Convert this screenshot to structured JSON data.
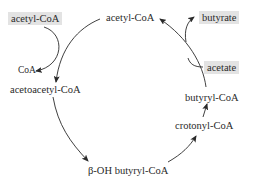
{
  "diagram": {
    "type": "metabolic-cycle",
    "nodes": {
      "acetyl_coa_input": "acetyl-CoA",
      "acetyl_coa": "acetyl-CoA",
      "butyrate": "butyrate",
      "coa": "CoA",
      "acetoacetyl_coa": "acetoacetyl-CoA",
      "acetate": "acetate",
      "butyryl_coa": "butyryl-CoA",
      "crotonyl_coa": "crotonyl-CoA",
      "beta_oh_butyryl_coa": "β-OH butyryl-CoA"
    },
    "edges": [
      {
        "from": "acetyl-CoA",
        "to": "acetoacetyl-CoA"
      },
      {
        "from": "acetyl-CoA (input)",
        "to": "acetoacetyl-CoA"
      },
      {
        "from": "acetyl-CoA (input)",
        "to": "CoA"
      },
      {
        "from": "acetoacetyl-CoA",
        "to": "β-OH butyryl-CoA"
      },
      {
        "from": "β-OH butyryl-CoA",
        "to": "crotonyl-CoA"
      },
      {
        "from": "crotonyl-CoA",
        "to": "butyryl-CoA"
      },
      {
        "from": "butyryl-CoA",
        "to": "acetyl-CoA"
      },
      {
        "from": "acetate",
        "to": "acetyl-CoA"
      },
      {
        "from": "butyryl-CoA",
        "to": "butyrate"
      }
    ],
    "colors": {
      "highlight_box": "#e3e3e3",
      "line": "#2a2a2a"
    }
  }
}
